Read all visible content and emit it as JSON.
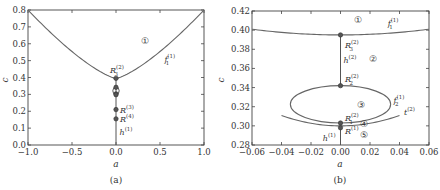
{
  "chart_data": [
    {
      "type": "line",
      "panel": "a",
      "caption": "(a)",
      "xlabel": "a",
      "ylabel": "c",
      "xlim": [
        -1.0,
        1.0
      ],
      "ylim": [
        0.0,
        0.8
      ],
      "xticks": [
        -1.0,
        -0.5,
        0.0,
        0.5,
        1.0
      ],
      "xtick_labels": [
        "−1.0",
        "−0.5",
        "0.0",
        "0.5",
        "1.0"
      ],
      "yticks": [
        0.0,
        0.1,
        0.2,
        0.3,
        0.4,
        0.5,
        0.6,
        0.7,
        0.8
      ],
      "ytick_labels": [
        "0.0",
        "0.1",
        "0.2",
        "0.3",
        "0.4",
        "0.5",
        "0.6",
        "0.7",
        "0.8"
      ],
      "series": [
        {
          "name": "f1(1)",
          "label": "f",
          "sub": "1",
          "sup": "(1)",
          "x": [
            -1.0,
            -0.8,
            -0.6,
            -0.4,
            -0.2,
            0.0,
            0.2,
            0.4,
            0.6,
            0.8,
            1.0
          ],
          "y": [
            0.8,
            0.68,
            0.585,
            0.505,
            0.44,
            0.395,
            0.44,
            0.505,
            0.585,
            0.68,
            0.8
          ]
        },
        {
          "name": "h(1)",
          "label": "h",
          "sup": "(1)",
          "x": [
            0.0,
            0.0
          ],
          "y": [
            0.0,
            0.395
          ]
        }
      ],
      "points": [
        {
          "name": "R3(2)",
          "label": "R",
          "sub": "3",
          "sup": "(2)",
          "x": 0.0,
          "y": 0.395
        },
        {
          "name": "R2(2)",
          "x": 0.0,
          "y": 0.342
        },
        {
          "name": "R1(2)",
          "x": 0.0,
          "y": 0.303
        },
        {
          "name": "R(1)",
          "x": 0.0,
          "y": 0.298
        },
        {
          "name": "R(3)",
          "label": "R",
          "sup": "(3)",
          "x": 0.0,
          "y": 0.21
        },
        {
          "name": "R(4)",
          "label": "R",
          "sup": "(4)",
          "x": 0.0,
          "y": 0.155
        }
      ],
      "region_labels": [
        {
          "text": "①",
          "x": 0.33,
          "y": 0.6
        }
      ],
      "small_loop": {
        "x": 0.0,
        "y_center": 0.32,
        "y_range": [
          0.3,
          0.342
        ]
      }
    },
    {
      "type": "line",
      "panel": "b",
      "caption": "(b)",
      "xlabel": "a",
      "ylabel": "c",
      "xlim": [
        -0.06,
        0.06
      ],
      "ylim": [
        0.28,
        0.42
      ],
      "xticks": [
        -0.06,
        -0.04,
        -0.02,
        0.0,
        0.02,
        0.04,
        0.06
      ],
      "xtick_labels": [
        "−0.06",
        "−0.04",
        "−0.02",
        "0.00",
        "0.02",
        "0.04",
        "0.06"
      ],
      "yticks": [
        0.28,
        0.3,
        0.32,
        0.34,
        0.36,
        0.38,
        0.4,
        0.42
      ],
      "ytick_labels": [
        "0.28",
        "0.30",
        "0.32",
        "0.34",
        "0.36",
        "0.38",
        "0.40",
        "0.42"
      ],
      "series": [
        {
          "name": "f1(1)",
          "label": "f",
          "sub": "1",
          "sup": "(1)",
          "x": [
            -0.06,
            -0.04,
            -0.02,
            0.0,
            0.02,
            0.04,
            0.06
          ],
          "y": [
            0.401,
            0.398,
            0.396,
            0.395,
            0.396,
            0.398,
            0.401
          ]
        },
        {
          "name": "f2(1)",
          "label": "f",
          "sub": "2",
          "sup": "(1)",
          "shape": "ellipse",
          "center": [
            0.0,
            0.3225
          ],
          "semi_axes": [
            0.034,
            0.0195
          ]
        },
        {
          "name": "t(2)",
          "label": "t",
          "sup": "(2)",
          "x": [
            -0.04,
            -0.02,
            0.0,
            0.02,
            0.04
          ],
          "y": [
            0.311,
            0.303,
            0.3,
            0.303,
            0.31
          ]
        },
        {
          "name": "h(2)",
          "label": "h",
          "sup": "(2)",
          "x": [
            0.0,
            0.0
          ],
          "y": [
            0.342,
            0.395
          ]
        },
        {
          "name": "h(1)",
          "label": "h",
          "sup": "(1)",
          "x": [
            0.0,
            0.0
          ],
          "y": [
            0.28,
            0.298
          ]
        }
      ],
      "points": [
        {
          "name": "R3(2)",
          "label": "R",
          "sub": "3",
          "sup": "(2)",
          "x": 0.0,
          "y": 0.395
        },
        {
          "name": "R2(2)",
          "label": "R",
          "sub": "2",
          "sup": "(2)",
          "x": 0.0,
          "y": 0.342
        },
        {
          "name": "R1(2)",
          "label": "R",
          "sub": "1",
          "sup": "(2)",
          "x": 0.0,
          "y": 0.303
        },
        {
          "name": "R(1)",
          "label": "R",
          "sup": "(1)",
          "x": 0.0,
          "y": 0.298
        }
      ],
      "region_labels": [
        {
          "text": "①",
          "x": 0.012,
          "y": 0.411
        },
        {
          "text": "②",
          "x": 0.022,
          "y": 0.37
        },
        {
          "text": "③",
          "x": 0.014,
          "y": 0.322
        },
        {
          "text": "④",
          "x": 0.016,
          "y": 0.302
        },
        {
          "text": "⑤",
          "x": 0.016,
          "y": 0.29
        }
      ]
    }
  ]
}
